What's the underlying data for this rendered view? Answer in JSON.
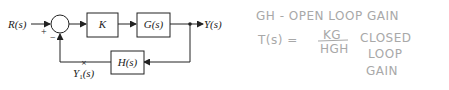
{
  "diagram": {
    "input_label": "R(s)",
    "output_label": "Y(s)",
    "sum_signs": {
      "plus": "+",
      "minus": "−"
    },
    "blocks": {
      "controller": "K",
      "plant": "G(s)",
      "feedback": "H(s)"
    },
    "measurement_point_label": "Y",
    "measurement_point_sub": "1",
    "measurement_point_arg": "(s)"
  },
  "notes": {
    "line1": "GH - OPEN LOOP GAIN",
    "tf_lhs": "T(s) =",
    "tf_numerator": "KG",
    "tf_denominator": "HGH",
    "closed_1": "CLOSED",
    "closed_2": "LOOP",
    "closed_3": "GAIN"
  },
  "colors": {
    "ink": "#222222",
    "pencil": "#a8a8a8"
  }
}
